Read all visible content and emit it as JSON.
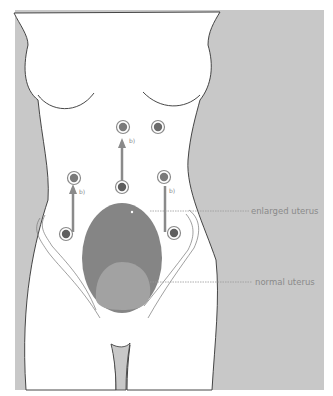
{
  "figure": {
    "labels": {
      "enlarged_uterus": "enlarged uterus",
      "normal_uterus": "normal uterus"
    },
    "port_labels": [
      "b)",
      "b)",
      "b)"
    ],
    "colors": {
      "background_gray": "#c8c8c8",
      "body_fill": "#ffffff",
      "outline": "#333333",
      "enlarged_uterus": "#858585",
      "normal_uterus": "#a2a2a2",
      "arrow": "#8a8a8a",
      "port_dark": "#6a6a6a",
      "label_text": "#8a8a8a"
    }
  }
}
